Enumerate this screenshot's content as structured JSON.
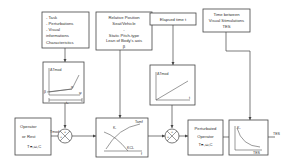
{
  "inputs": {
    "task_box": {
      "lines": [
        "- Task",
        "- Perturbations",
        "- Visual",
        "informations",
        "Characteristics"
      ]
    },
    "position_box": {
      "lines": [
        "Relative Position",
        "Seat/Vehicle",
        "-",
        "Static Pitch-type",
        "Lean of Body's axis",
        "β"
      ]
    },
    "elapsed_box": {
      "lines": [
        "Elapsed time t"
      ]
    },
    "time_between_box": {
      "lines": [
        "Time between",
        "Visual Stimulations",
        "TES"
      ]
    }
  },
  "graphs": {
    "psi_graph": {
      "y_label": "ΔTmod",
      "x_label": "ψ",
      "x_axis_label": "t",
      "tick_label": "t₀",
      "angle_label": "α",
      "origin_label": "β"
    },
    "time_graph": {
      "y_label": "ΔTmod",
      "x_label": "t"
    },
    "crossover_graph": {
      "y_label": "Kᵢ",
      "curve1_label": "Tamf",
      "curve2_label": "KCL",
      "x_label": "f"
    },
    "tes_graph": {
      "y_label": "K₁",
      "x_label": "TES"
    }
  },
  "blocks": {
    "operator": {
      "lines": [
        "Operator",
        "or Rest",
        "Tₘ,ω,C"
      ]
    },
    "perturbed_operator": {
      "lines": [
        "Perturbated",
        "Operator",
        "Tₘ,ω,C"
      ]
    }
  },
  "signals": {
    "tmod_label": "Tmod",
    "junction1_signs": [
      "+",
      "+"
    ],
    "junction2_signs": [
      "+",
      "+"
    ],
    "output_label": "TES"
  }
}
